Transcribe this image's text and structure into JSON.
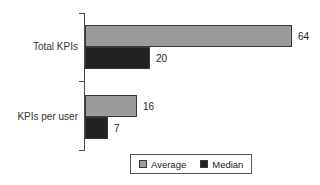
{
  "chart_data": {
    "type": "bar",
    "orientation": "horizontal",
    "title": "",
    "xlabel": "",
    "ylabel": "",
    "categories": [
      "Total KPIs",
      "KPIs per user"
    ],
    "series": [
      {
        "name": "Average",
        "color": "#9b9b9b",
        "values": [
          64,
          16
        ]
      },
      {
        "name": "Median",
        "color": "#222222",
        "values": [
          20,
          7
        ]
      }
    ],
    "xlim": [
      0,
      64
    ],
    "grid": false,
    "value_labels": true,
    "legend_position": "bottom"
  }
}
